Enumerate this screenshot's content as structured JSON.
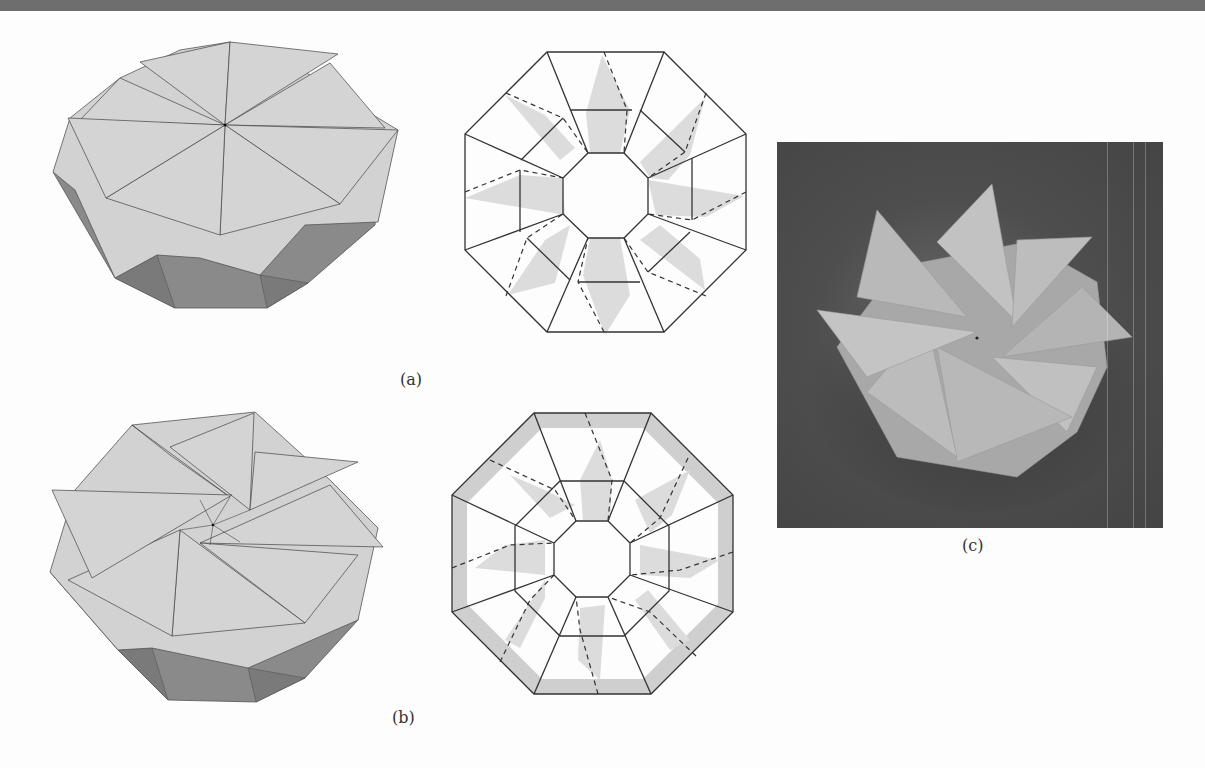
{
  "page": {
    "type": "figure"
  },
  "colors": {
    "paper_light": "#cfcfcf",
    "paper_side": "#8a8a8a",
    "crease_line": "#333333",
    "shade_fill": "#dddddd",
    "photo_bg": "#4a4a4a",
    "header_bar": "#6e6e6e"
  },
  "figures": [
    {
      "id": "a",
      "label": "(a)",
      "render": "3D octagonal twist fold with eight triangular flaps meeting at a single center point",
      "crease_pattern": "Octagon with inner octagonal hole, trapezoidal ring, dashed valley folds and shaded flap regions"
    },
    {
      "id": "b",
      "label": "(b)",
      "render": "3D octagonal twist fold with eight triangular flaps arranged in a spiral around a small central octagon",
      "crease_pattern": "Octagon with two concentric inner octagons, shaded outer border band, dashed valley folds and shaded flap regions"
    },
    {
      "id": "c",
      "label": "(c)",
      "render": "Photograph of a folded paper model with spiralling triangular flaps on a dark background"
    }
  ]
}
